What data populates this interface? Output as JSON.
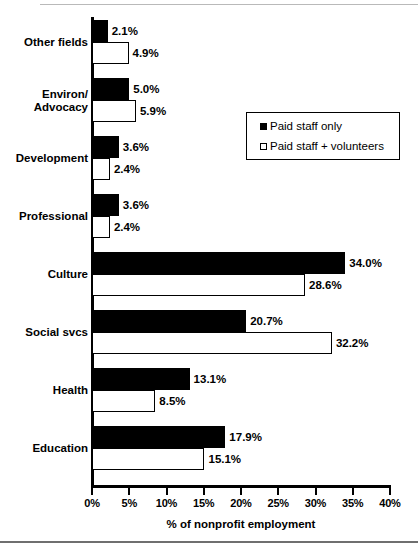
{
  "chart_data": {
    "type": "bar",
    "orientation": "horizontal",
    "title": "",
    "xlabel": "% of nonprofit employment",
    "ylabel": "",
    "xlim": [
      0,
      40
    ],
    "xticks": [
      "0%",
      "5%",
      "10%",
      "15%",
      "20%",
      "25%",
      "30%",
      "35%",
      "40%"
    ],
    "xtick_values": [
      0,
      5,
      10,
      15,
      20,
      25,
      30,
      35,
      40
    ],
    "grid": false,
    "legend_position": "upper right inside plot",
    "categories": [
      "Other fields",
      "Environ/\nAdvocacy",
      "Development",
      "Professional",
      "Culture",
      "Social svcs",
      "Health",
      "Education"
    ],
    "series": [
      {
        "name": "Paid staff only",
        "style": "filled-black",
        "values": [
          2.1,
          5.0,
          3.6,
          3.6,
          34.0,
          20.7,
          13.1,
          17.9
        ],
        "labels": [
          "2.1%",
          "5.0%",
          "3.6%",
          "3.6%",
          "34.0%",
          "20.7%",
          "13.1%",
          "17.9%"
        ]
      },
      {
        "name": "Paid staff + volunteers",
        "style": "hollow-white",
        "values": [
          4.9,
          5.9,
          2.4,
          2.4,
          28.6,
          32.2,
          8.5,
          15.1
        ],
        "labels": [
          "4.9%",
          "5.9%",
          "2.4%",
          "2.4%",
          "28.6%",
          "32.2%",
          "8.5%",
          "15.1%"
        ]
      }
    ]
  },
  "legend": {
    "items": [
      {
        "label": "Paid staff only",
        "swatch": "filled-square-black"
      },
      {
        "label": "Paid staff + volunteers",
        "swatch": "hollow-square-white"
      }
    ]
  },
  "colors": {
    "paid_staff_only": "#000000",
    "paid_staff_plus_volunteers": "#ffffff",
    "axis": "#000000",
    "background": "#ffffff"
  }
}
